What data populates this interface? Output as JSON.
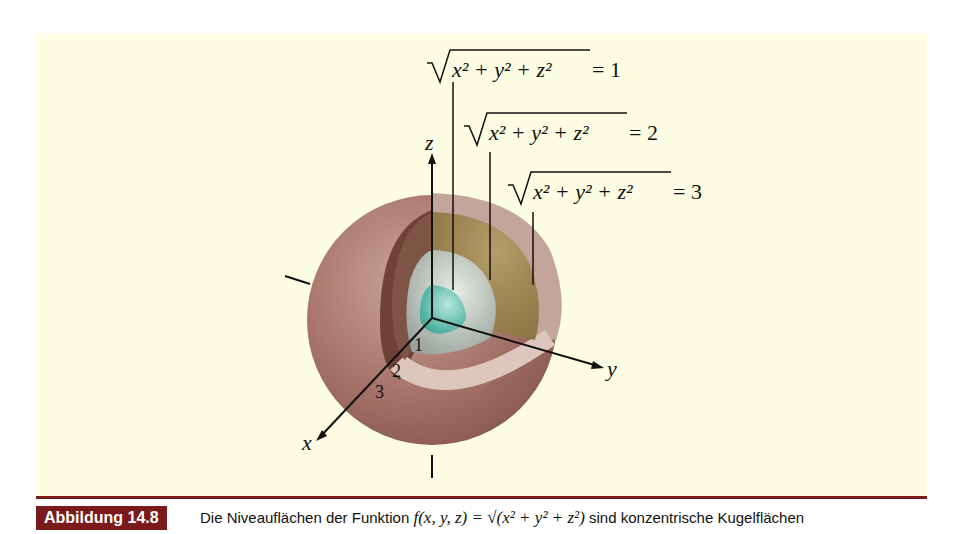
{
  "figure": {
    "labels": [
      {
        "radicand": "x² + y² + z²",
        "value": "= 1"
      },
      {
        "radicand": "x² + y² + z²",
        "value": "= 2"
      },
      {
        "radicand": "x² + y² + z²",
        "value": "= 3"
      }
    ],
    "axes": {
      "x": "x",
      "y": "y",
      "z": "z"
    },
    "ticks": [
      "1",
      "2",
      "3"
    ],
    "colors": {
      "panel_bg": "#fdfde4",
      "outer_sphere": "#a8756a",
      "middle_shell": "#9c8452",
      "inner_shell": "#c9cfc6",
      "core": "#5fbcae",
      "accent": "#7b1a1a"
    }
  },
  "caption": {
    "badge": "Abbildung 14.8",
    "text_pre": "Die Niveauflächen der Funktion ",
    "math": "f(x, y, z) = √(x² + y² + z²)",
    "text_post": " sind konzentrische Kugelflächen"
  }
}
